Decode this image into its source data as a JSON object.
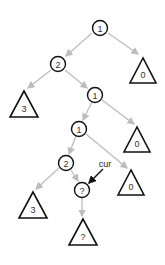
{
  "diagram": {
    "type": "tree",
    "colors": {
      "edge": "#bdbdbd",
      "node_stroke": "#111111",
      "pointer": "#111111"
    },
    "nodes": [
      {
        "id": "n1",
        "shape": "circle",
        "label": "1",
        "x": 100,
        "y": 28
      },
      {
        "id": "n2",
        "shape": "circle",
        "label": "2",
        "x": 58,
        "y": 64
      },
      {
        "id": "t0a",
        "shape": "triangle",
        "label": "0",
        "x": 143,
        "y": 74
      },
      {
        "id": "t3a",
        "shape": "triangle",
        "label": "3",
        "x": 24,
        "y": 106
      },
      {
        "id": "n3",
        "shape": "circle",
        "label": "1",
        "x": 95,
        "y": 95
      },
      {
        "id": "n4",
        "shape": "circle",
        "label": "1",
        "x": 79,
        "y": 129
      },
      {
        "id": "t0b",
        "shape": "triangle",
        "label": "0",
        "x": 137,
        "y": 143
      },
      {
        "id": "n5",
        "shape": "circle",
        "label": "2",
        "x": 66,
        "y": 163
      },
      {
        "id": "t0c",
        "shape": "triangle",
        "label": "0",
        "x": 131,
        "y": 186
      },
      {
        "id": "n6",
        "shape": "circle",
        "label": "?",
        "x": 82,
        "y": 190
      },
      {
        "id": "t3b",
        "shape": "triangle",
        "label": "3",
        "x": 33,
        "y": 208
      },
      {
        "id": "t4",
        "shape": "triangle",
        "label": "?",
        "x": 83,
        "y": 236
      }
    ],
    "pointer": {
      "label": "cur",
      "target": "n6"
    }
  }
}
